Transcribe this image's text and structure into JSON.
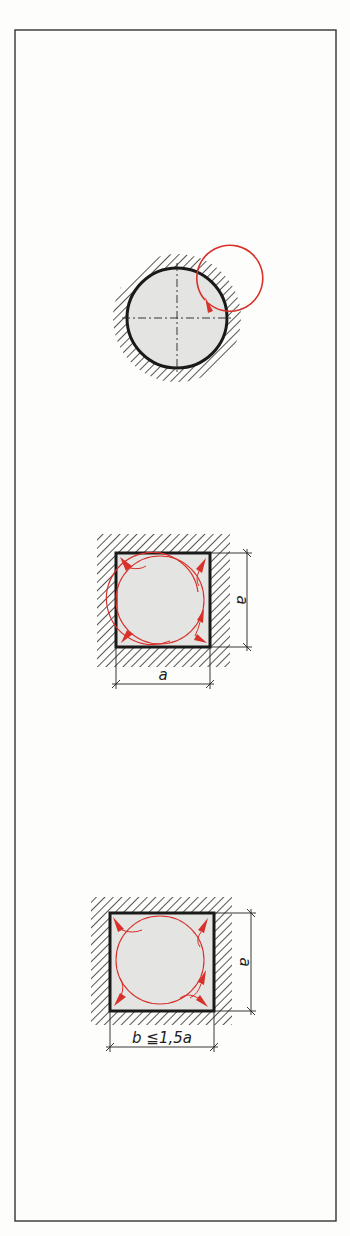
{
  "figure": {
    "colors": {
      "outline": "#1a1a1a",
      "hatch": "#2a2a2a",
      "fill": "#e4e4e2",
      "flow": "#d8302a",
      "frame": "#333333",
      "background": "#fdfdfb"
    },
    "sections": [
      {
        "shape": "circle",
        "label": "round section",
        "flow": "single rotating swirl"
      },
      {
        "shape": "square",
        "label": "square section",
        "dim_right": "a",
        "dim_bottom": "a",
        "flow": "swirl with corner vortices"
      },
      {
        "shape": "rectangle",
        "label": "rectangular section",
        "dim_right": "a",
        "dim_bottom": "b ≦1,5a",
        "flow": "swirl with corner vortices"
      }
    ]
  }
}
